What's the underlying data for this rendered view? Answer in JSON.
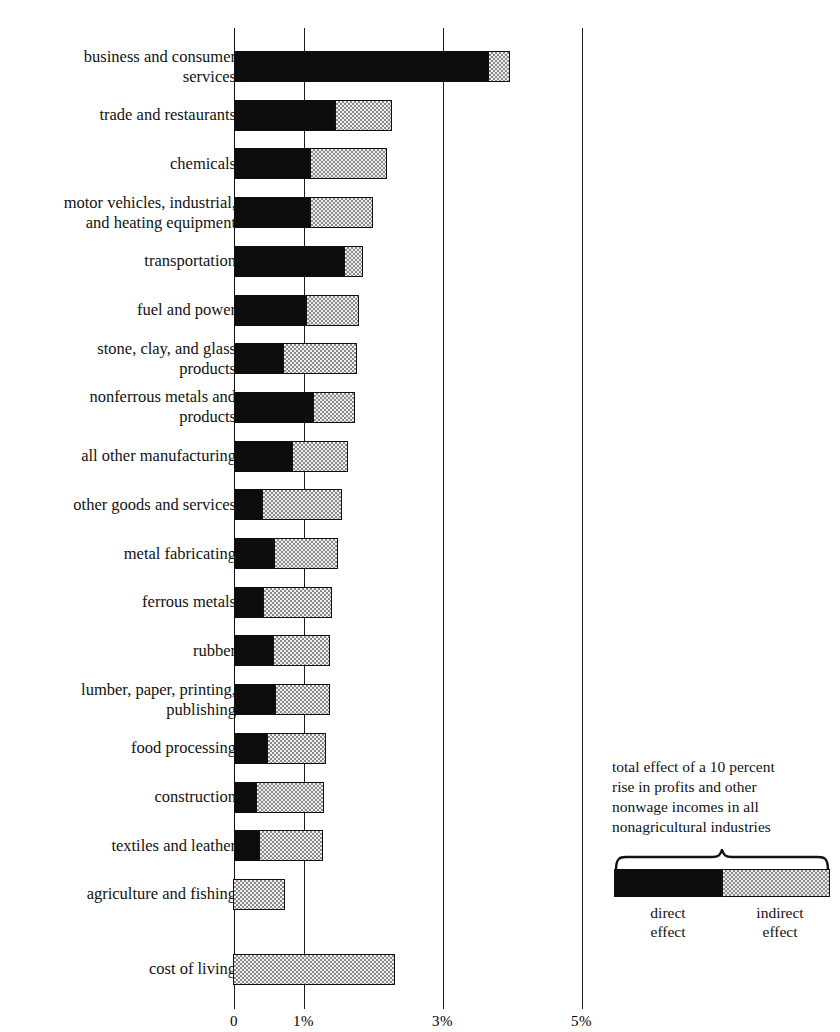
{
  "chart_data": {
    "type": "bar",
    "orientation": "horizontal",
    "stacked": true,
    "title": "",
    "xlabel": "",
    "ylabel": "",
    "xlim": [
      0,
      5.6
    ],
    "grid": true,
    "gridlines": [
      0,
      1,
      3,
      5
    ],
    "axis_ticks": [
      {
        "value": 0,
        "label": "0"
      },
      {
        "value": 1,
        "label": "1%"
      },
      {
        "value": 3,
        "label": "3%"
      },
      {
        "value": 5,
        "label": "5%"
      }
    ],
    "series": [
      {
        "name": "direct effect",
        "color": "#0d0d0d",
        "values": [
          3.65,
          1.45,
          1.09,
          1.09,
          1.58,
          1.03,
          0.71,
          1.14,
          0.83,
          0.4,
          0.58,
          0.42,
          0.56,
          0.59,
          0.47,
          0.32,
          0.36,
          0.0,
          0.0
        ]
      },
      {
        "name": "indirect effect",
        "color": "#d7d7d7",
        "values": [
          0.32,
          0.82,
          1.11,
          0.91,
          0.28,
          0.77,
          1.06,
          0.6,
          0.81,
          1.15,
          0.92,
          0.99,
          0.82,
          0.79,
          0.85,
          0.98,
          0.92,
          0.75,
          2.33
        ]
      }
    ],
    "categories": [
      "business and consumer\nservices",
      "trade and restaurants",
      "chemicals",
      "motor vehicles, industrial,\nand heating equipment",
      "transportation",
      "fuel and power",
      "stone, clay, and glass\nproducts",
      "nonferrous metals and\nproducts",
      "all other manufacturing",
      "other goods and services",
      "metal fabricating",
      "ferrous metals",
      "rubber",
      "lumber, paper, printing,\npublishing",
      "food processing",
      "construction",
      "textiles and leather",
      "agriculture and fishing",
      "cost of living"
    ],
    "totals": [
      3.97,
      2.27,
      2.2,
      2.0,
      1.86,
      1.8,
      1.77,
      1.74,
      1.64,
      1.55,
      1.5,
      1.41,
      1.38,
      1.38,
      1.32,
      1.3,
      1.28,
      0.75,
      2.33
    ]
  },
  "legend": {
    "caption": "total effect of a 10 percent\nrise in profits and other\nnonwage incomes in all\nnonagricultural industries",
    "direct_label": "direct\neffect",
    "indirect_label": "indirect\neffect",
    "direct_color": "#0d0d0d",
    "indirect_color": "#d7d7d7"
  }
}
